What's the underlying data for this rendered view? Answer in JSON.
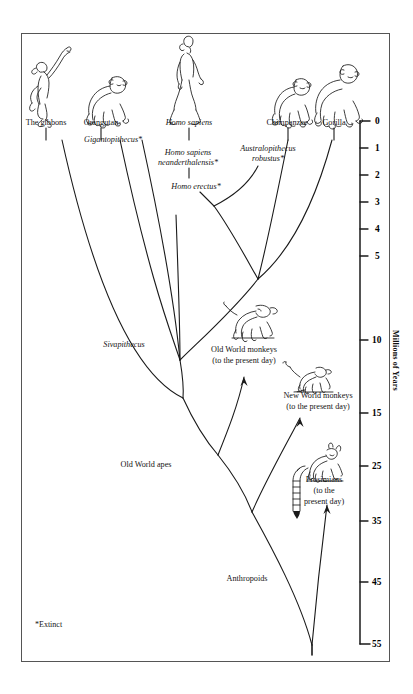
{
  "figure": {
    "background": "#ffffff",
    "ink": "#1a1a1a",
    "frame_color": "#555555"
  },
  "footnote": "*Extinct",
  "axis": {
    "title": "Millions of Years",
    "ticks": [
      {
        "label": "0",
        "y": 121
      },
      {
        "label": "1",
        "y": 148
      },
      {
        "label": "2",
        "y": 175
      },
      {
        "label": "3",
        "y": 202
      },
      {
        "label": "4",
        "y": 229
      },
      {
        "label": "5",
        "y": 256
      },
      {
        "label": "10",
        "y": 340
      },
      {
        "label": "15",
        "y": 413
      },
      {
        "label": "25",
        "y": 466
      },
      {
        "label": "35",
        "y": 521
      },
      {
        "label": "45",
        "y": 582
      },
      {
        "label": "55",
        "y": 644
      }
    ]
  },
  "taxa": [
    {
      "name": "The gibbons",
      "x": 46,
      "y": 122,
      "italic": false,
      "align": "center"
    },
    {
      "name": "Orangutan",
      "x": 101,
      "y": 122,
      "italic": false,
      "align": "center"
    },
    {
      "name": "Homo sapiens",
      "x": 189,
      "y": 122,
      "italic": true,
      "align": "center"
    },
    {
      "name": "Chimpanzee",
      "x": 287,
      "y": 122,
      "italic": false,
      "align": "center"
    },
    {
      "name": "Gorilla",
      "x": 334,
      "y": 122,
      "italic": false,
      "align": "center"
    },
    {
      "name": "Gigantopithecus*",
      "x": 118,
      "y": 139,
      "italic": true,
      "align": "left"
    },
    {
      "name": "Homo sapiens",
      "x": 188,
      "y": 152,
      "italic": true,
      "align": "center"
    },
    {
      "name": "neanderthalensis*",
      "x": 188,
      "y": 162,
      "italic": true,
      "align": "center"
    },
    {
      "name": "Australopithecus",
      "x": 268,
      "y": 148,
      "italic": true,
      "align": "center"
    },
    {
      "name": "robustus*",
      "x": 268,
      "y": 158,
      "italic": true,
      "align": "center"
    },
    {
      "name": "Homo erectus*",
      "x": 196,
      "y": 186,
      "italic": true,
      "align": "center"
    },
    {
      "name": "Sivapithecus",
      "x": 124,
      "y": 344,
      "italic": true,
      "align": "center"
    },
    {
      "name": "Old World monkeys",
      "x": 244,
      "y": 349,
      "italic": false,
      "align": "center"
    },
    {
      "name": "(to the present day)",
      "x": 244,
      "y": 360,
      "italic": false,
      "align": "center"
    },
    {
      "name": "New World monkeys",
      "x": 318,
      "y": 395,
      "italic": false,
      "align": "center"
    },
    {
      "name": "(to the present day)",
      "x": 318,
      "y": 406,
      "italic": false,
      "align": "center"
    },
    {
      "name": "Old World apes",
      "x": 146,
      "y": 464,
      "italic": false,
      "align": "center"
    },
    {
      "name": "Prosimians",
      "x": 324,
      "y": 479,
      "italic": false,
      "align": "center"
    },
    {
      "name": "(to the",
      "x": 324,
      "y": 490,
      "italic": false,
      "align": "center"
    },
    {
      "name": "present day)",
      "x": 324,
      "y": 501,
      "italic": false,
      "align": "center"
    },
    {
      "name": "Anthropoids",
      "x": 247,
      "y": 578,
      "italic": false,
      "align": "center"
    }
  ]
}
